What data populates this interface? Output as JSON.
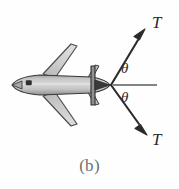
{
  "figure": {
    "caption": "(b)",
    "background_color": "#fefefe",
    "labels": {
      "thrust_upper": "T",
      "thrust_lower": "T",
      "angle_upper": "θ",
      "angle_lower": "θ"
    },
    "colors": {
      "ink": "#2b2b2b",
      "body_fill": "#bdbdbd",
      "body_fill_light": "#d6d6d6",
      "wing_fill": "#c9c9c9",
      "outline": "#3a3a3a",
      "caption_color": "#6f6f6f",
      "reference_line": "#5a5a5a"
    },
    "geometry": {
      "vertex_x": 111,
      "vertex_y": 85,
      "reference_line_x1": 114,
      "reference_line_x2": 156,
      "reference_line_y": 85,
      "upper_arrow_tip_x": 144,
      "upper_arrow_tip_y": 32,
      "lower_arrow_tip_x": 146,
      "lower_arrow_tip_y": 132,
      "angle_degrees": 58
    }
  }
}
